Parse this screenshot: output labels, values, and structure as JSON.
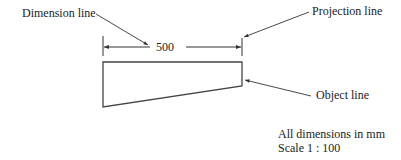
{
  "labels": {
    "dimension_line": "Dimension line",
    "projection_line": "Projection line",
    "object_line": "Object line",
    "dimension_value": "500",
    "units_note": "All dimensions in mm",
    "scale_note": "Scale 1 : 100"
  },
  "colors": {
    "line": "#333333",
    "background": "#ffffff"
  }
}
